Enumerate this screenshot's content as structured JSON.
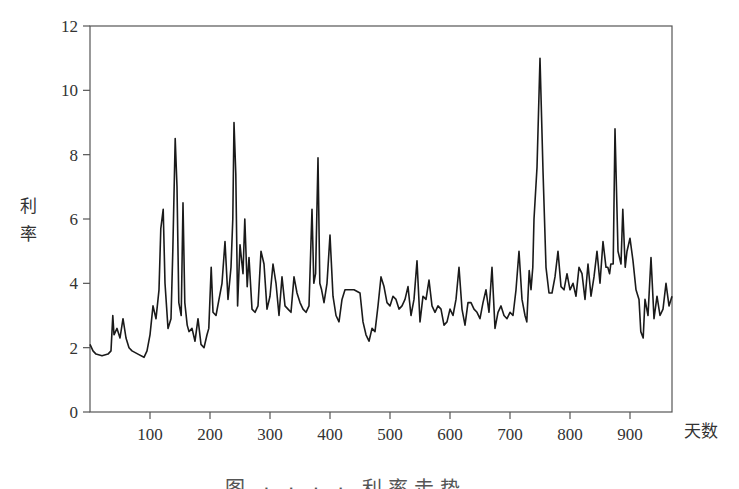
{
  "chart_data": {
    "type": "line",
    "title": "",
    "xlabel": "天数",
    "ylabel": "利率",
    "xlim": [
      0,
      970
    ],
    "ylim": [
      0,
      12
    ],
    "grid": false,
    "legend": null,
    "x_ticks": [
      100,
      200,
      300,
      400,
      500,
      600,
      700,
      800,
      900
    ],
    "y_ticks": [
      0,
      2,
      4,
      6,
      8,
      10,
      12
    ],
    "series": [
      {
        "name": "利率",
        "color": "#1a1a1a",
        "x": [
          0,
          5,
          10,
          20,
          30,
          35,
          38,
          40,
          45,
          50,
          55,
          60,
          65,
          70,
          80,
          90,
          95,
          100,
          105,
          110,
          115,
          118,
          122,
          125,
          130,
          135,
          138,
          142,
          145,
          148,
          152,
          155,
          158,
          162,
          165,
          170,
          175,
          180,
          185,
          190,
          195,
          198,
          202,
          205,
          210,
          215,
          220,
          225,
          230,
          235,
          238,
          240,
          243,
          246,
          250,
          255,
          258,
          262,
          265,
          270,
          275,
          280,
          285,
          290,
          295,
          300,
          305,
          310,
          315,
          320,
          325,
          330,
          335,
          340,
          345,
          350,
          355,
          360,
          365,
          370,
          373,
          376,
          380,
          383,
          386,
          390,
          395,
          400,
          405,
          410,
          415,
          420,
          425,
          430,
          440,
          450,
          455,
          460,
          465,
          470,
          475,
          480,
          485,
          490,
          495,
          500,
          505,
          510,
          515,
          520,
          525,
          530,
          535,
          540,
          545,
          550,
          555,
          560,
          565,
          570,
          575,
          580,
          585,
          590,
          595,
          600,
          605,
          610,
          615,
          620,
          625,
          630,
          635,
          640,
          645,
          650,
          655,
          660,
          665,
          670,
          675,
          680,
          685,
          690,
          695,
          700,
          705,
          710,
          715,
          720,
          725,
          728,
          732,
          735,
          738,
          740,
          745,
          750,
          755,
          760,
          765,
          770,
          775,
          780,
          785,
          790,
          795,
          800,
          805,
          810,
          815,
          820,
          825,
          830,
          835,
          840,
          845,
          850,
          855,
          860,
          863,
          866,
          868,
          872,
          875,
          880,
          885,
          888,
          892,
          895,
          900,
          905,
          910,
          915,
          918,
          922,
          925,
          930,
          935,
          940,
          945,
          950,
          955,
          960,
          965,
          970
        ],
        "y": [
          2.1,
          1.9,
          1.8,
          1.75,
          1.8,
          1.9,
          3.0,
          2.4,
          2.6,
          2.3,
          2.9,
          2.3,
          2.0,
          1.9,
          1.8,
          1.7,
          1.9,
          2.4,
          3.3,
          2.9,
          3.8,
          5.7,
          6.3,
          4.0,
          2.6,
          2.9,
          5.0,
          8.5,
          7.0,
          3.4,
          3.0,
          6.5,
          3.4,
          2.7,
          2.5,
          2.6,
          2.2,
          2.9,
          2.1,
          2.0,
          2.4,
          2.6,
          4.5,
          3.1,
          3.0,
          3.5,
          4.0,
          5.3,
          3.5,
          4.5,
          6.0,
          9.0,
          7.4,
          3.3,
          5.2,
          4.3,
          6.0,
          3.9,
          4.8,
          3.2,
          3.1,
          3.3,
          5.0,
          4.6,
          3.2,
          3.6,
          4.6,
          4.0,
          3.0,
          4.2,
          3.3,
          3.2,
          3.1,
          4.2,
          3.7,
          3.4,
          3.2,
          3.1,
          3.3,
          6.3,
          4.0,
          4.3,
          7.9,
          4.0,
          3.8,
          3.4,
          4.0,
          5.5,
          3.6,
          3.0,
          2.8,
          3.5,
          3.8,
          3.8,
          3.8,
          3.7,
          2.8,
          2.4,
          2.2,
          2.6,
          2.5,
          3.3,
          4.2,
          3.9,
          3.4,
          3.3,
          3.6,
          3.5,
          3.2,
          3.3,
          3.5,
          3.9,
          3.0,
          3.5,
          4.7,
          2.8,
          3.6,
          3.5,
          4.1,
          3.3,
          3.1,
          3.3,
          3.2,
          2.7,
          2.8,
          3.2,
          3.0,
          3.5,
          4.5,
          3.2,
          2.7,
          3.4,
          3.4,
          3.2,
          3.1,
          2.9,
          3.4,
          3.8,
          3.1,
          4.5,
          2.6,
          3.1,
          3.3,
          3.0,
          2.9,
          3.1,
          3.0,
          3.8,
          5.0,
          3.5,
          3.0,
          2.8,
          4.4,
          3.8,
          4.5,
          6.0,
          7.6,
          11.0,
          7.5,
          4.5,
          3.7,
          3.7,
          4.2,
          5.0,
          3.9,
          3.8,
          4.3,
          3.8,
          4.0,
          3.6,
          4.5,
          4.3,
          3.5,
          4.6,
          3.6,
          4.2,
          5.0,
          4.0,
          5.3,
          4.5,
          4.5,
          4.3,
          4.6,
          4.6,
          8.8,
          5.0,
          4.6,
          6.3,
          4.5,
          5.0,
          5.4,
          4.7,
          3.8,
          3.5,
          2.5,
          2.3,
          3.5,
          3.0,
          4.8,
          2.9,
          3.6,
          3.0,
          3.2,
          4.0,
          3.3,
          3.6
        ]
      }
    ]
  },
  "axes": {
    "xlabel": "天数",
    "ylabel_line1": "利",
    "ylabel_line2": "率",
    "x_tick_labels": [
      "100",
      "200",
      "300",
      "400",
      "500",
      "600",
      "700",
      "800",
      "900"
    ],
    "y_tick_labels": [
      "0",
      "2",
      "4",
      "6",
      "8",
      "10",
      "12"
    ]
  },
  "caption": {
    "text": "图 · · · · 利率走势",
    "note": "caption is cut off at the bottom edge of the image"
  }
}
